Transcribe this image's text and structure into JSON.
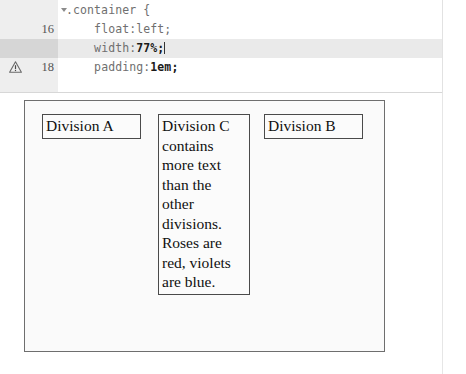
{
  "editor": {
    "lines": [
      {
        "number": "16",
        "has_fold_arrow": true,
        "has_warning": false,
        "active": false,
        "indent": "",
        "code_pre": ".container {",
        "code_val": "",
        "code_post": "",
        "caret": false
      },
      {
        "number": "17",
        "has_fold_arrow": false,
        "has_warning": false,
        "active": false,
        "indent": "    ",
        "code_pre": "float:left;",
        "code_val": "",
        "code_post": "",
        "caret": false
      },
      {
        "number": "18",
        "has_fold_arrow": false,
        "has_warning": false,
        "active": true,
        "indent": "    ",
        "code_pre": "width:",
        "code_val": "77%",
        "code_post": ";",
        "caret": true
      },
      {
        "number": "19",
        "has_fold_arrow": false,
        "has_warning": true,
        "active": false,
        "indent": "    ",
        "code_pre": "padding:",
        "code_val": "1em",
        "code_post": ";",
        "caret": false
      }
    ],
    "warning_icon_name": "warning-triangle-icon",
    "fold_icon_name": "fold-arrow-icon"
  },
  "preview": {
    "container_label": "container-box",
    "divisions": [
      {
        "id": "a",
        "text": "Division A"
      },
      {
        "id": "c",
        "text": "Division C contains more text than the other divisions. Roses are red, violets are blue."
      },
      {
        "id": "b",
        "text": "Division B"
      }
    ]
  },
  "colors": {
    "gutter_bg": "#eeeeee",
    "active_line_bg": "#eaeaea",
    "active_gutter_bg": "#d6d6d6",
    "code_text": "#6f6f6f",
    "code_value": "#1a1a1a",
    "container_border": "#6e6e6e",
    "division_border": "#4a4a4a",
    "preview_bg": "#fafafa"
  }
}
